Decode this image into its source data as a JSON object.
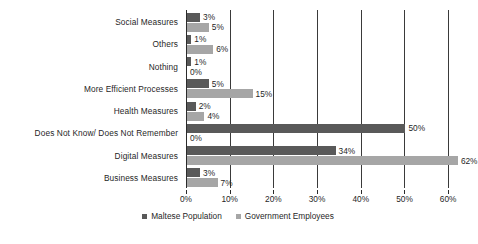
{
  "chart_data": {
    "type": "bar",
    "orientation": "horizontal",
    "title": "",
    "subtitle": "",
    "xlabel": "",
    "ylabel": "",
    "grid": true,
    "legend_position": "bottom",
    "xlim": [
      0,
      65
    ],
    "xticks": [
      0,
      10,
      20,
      30,
      40,
      50,
      60
    ],
    "xtick_labels": [
      "0%",
      "10%",
      "20%",
      "30%",
      "40%",
      "50%",
      "60%"
    ],
    "categories": [
      "Social Measures",
      "Others",
      "Nothing",
      "More Efficient Processes",
      "Health Measures",
      "Does Not Know/ Does Not Remember",
      "Digital Measures",
      "Business Measures"
    ],
    "series": [
      {
        "name": "Maltese Population",
        "color": "#595959",
        "values": [
          3,
          1,
          1,
          5,
          2,
          50,
          34,
          3
        ],
        "value_labels": [
          "3%",
          "1%",
          "1%",
          "5%",
          "2%",
          "50%",
          "34%",
          "3%"
        ]
      },
      {
        "name": "Government Employees",
        "color": "#a6a6a6",
        "values": [
          5,
          6,
          0,
          15,
          4,
          0,
          62,
          7
        ],
        "value_labels": [
          "5%",
          "6%",
          "0%",
          "15%",
          "4%",
          "0%",
          "62%",
          "7%"
        ]
      }
    ]
  },
  "legend": {
    "items": [
      {
        "label": "Maltese Population",
        "color": "#595959"
      },
      {
        "label": "Government Employees",
        "color": "#a6a6a6"
      }
    ]
  }
}
